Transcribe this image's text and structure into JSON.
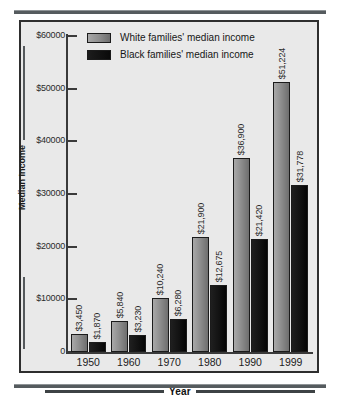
{
  "chart_data": {
    "type": "bar",
    "title": "",
    "xlabel": "Year",
    "ylabel": "Median Income",
    "categories": [
      "1950",
      "1960",
      "1970",
      "1980",
      "1990",
      "1999"
    ],
    "series": [
      {
        "name": "White families' median income",
        "color": "#8f8f8f",
        "values": [
          3450,
          5840,
          10240,
          21900,
          36900,
          51224
        ],
        "labels": [
          "$3,450",
          "$5,840",
          "$10,240",
          "$21,900",
          "$36,900",
          "$51,224"
        ]
      },
      {
        "name": "Black families' median income",
        "color": "#0a0a0a",
        "values": [
          1870,
          3230,
          6280,
          12675,
          21420,
          31778
        ],
        "labels": [
          "$1,870",
          "$3,230",
          "$6,280",
          "$12,675",
          "$21,420",
          "$31,778"
        ]
      }
    ],
    "ylim": [
      0,
      60000
    ],
    "yticks": [
      0,
      10000,
      20000,
      30000,
      40000,
      50000,
      60000
    ],
    "ytick_labels": [
      "0",
      "$10000",
      "$20000",
      "$30000",
      "$40000",
      "$50000",
      "$60000"
    ],
    "grid": false,
    "legend_position": "top-center"
  },
  "legend": {
    "items": [
      {
        "label": "White families' median income",
        "swatch": "white-series"
      },
      {
        "label": "Black families' median income",
        "swatch": "black-series"
      }
    ]
  },
  "axes": {
    "y_title": "Median Income",
    "x_title": "Year"
  }
}
